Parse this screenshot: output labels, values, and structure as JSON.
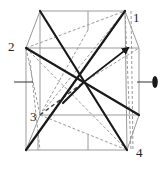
{
  "diagram": {
    "type": "cube-symmetry-axes",
    "labels": [
      {
        "id": "1",
        "text": "1",
        "x": 133,
        "y": 22
      },
      {
        "id": "2",
        "text": "2",
        "x": 8,
        "y": 51
      },
      {
        "id": "3",
        "text": "3",
        "x": 30,
        "y": 121
      },
      {
        "id": "4",
        "text": "4",
        "x": 136,
        "y": 157
      }
    ],
    "colors": {
      "edge": "#9a9a9a",
      "diagonal": "#1a1a1a",
      "dashed": "#9a9a9a",
      "axis": "#333333"
    },
    "axis_symbol": "two-fold-ellipse"
  }
}
